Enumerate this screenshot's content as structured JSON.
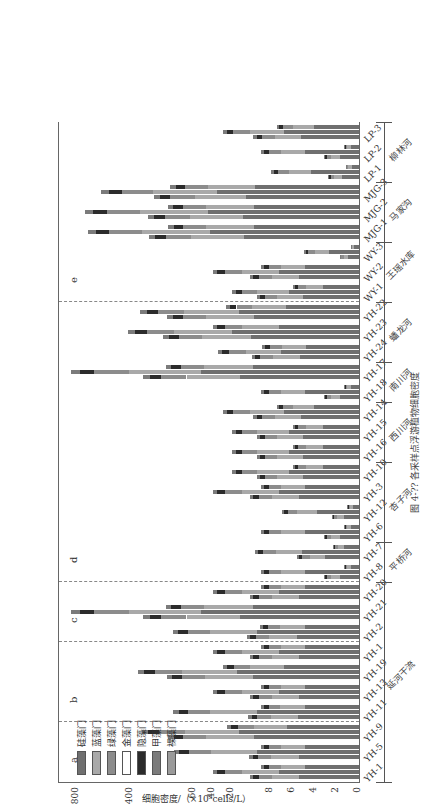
{
  "chart_data": {
    "type": "bar",
    "stacked": true,
    "orientation": "horizontal (figure rotated 90°)",
    "title": "",
    "ylabel": "细胞密度/（×10⁵cells/L）",
    "value_axis_ticks": [
      "0",
      "2",
      "4",
      "6",
      "8",
      "20",
      "40",
      "60",
      "400",
      "800"
    ],
    "axis_breaks": [
      [
        8,
        10
      ],
      [
        60,
        80
      ]
    ],
    "categories": [
      "YH-1",
      "YH-5",
      "YH-9",
      "YH-11",
      "YH-13",
      "YH-19",
      "YH-1",
      "YH-2",
      "YH-21",
      "YH-20",
      "YH-8",
      "YH-7",
      "YH-6",
      "YH-12",
      "YH-3",
      "YH-10",
      "YH-16",
      "YH-15",
      "YH-14",
      "YH-18",
      "YH-17",
      "YH-24",
      "YH-23",
      "YH-22",
      "WY-1",
      "WY-2",
      "WY-3",
      "MJG-1",
      "MJG-2",
      "MJG-3",
      "LP-1",
      "LP-2",
      "LP-3"
    ],
    "legend": [
      "硅藻门",
      "蓝藻门",
      "绿藻门",
      "金藻门",
      "隐藻门",
      "甲藻门",
      "裸藻门"
    ],
    "series_colors": [
      "#6f6f6f",
      "#a9a9a9",
      "#8c8c8c",
      "#ffffff",
      "#2b2b2b",
      "#7b7b7b",
      "#9a9a9a"
    ],
    "regions": [
      {
        "label": "a",
        "from": "YH-1",
        "to": "YH-9"
      },
      {
        "label": "b",
        "from": "YH-11",
        "to": "YH-1"
      },
      {
        "label": "c",
        "from": "YH-2",
        "to": "YH-20"
      },
      {
        "label": "d",
        "from": "YH-8",
        "to": "YH-22"
      },
      {
        "label": "e",
        "from": "WY-1",
        "to": "LP-3"
      }
    ],
    "groups": [
      {
        "label": "延河干流",
        "from": "YH-1",
        "to": "YH-20"
      },
      {
        "label": "平桥河",
        "from": "YH-8",
        "to": "YH-7"
      },
      {
        "label": "杏子河",
        "from": "YH-6",
        "to": "YH-10"
      },
      {
        "label": "西川河",
        "from": "YH-16",
        "to": "YH-14"
      },
      {
        "label": "南川河",
        "from": "YH-18",
        "to": "YH-17"
      },
      {
        "label": "蟠龙河",
        "from": "YH-24",
        "to": "YH-22"
      },
      {
        "label": "王瑶水库",
        "from": "WY-1",
        "to": "WY-3"
      },
      {
        "label": "马家沟",
        "from": "MJG-1",
        "to": "MJG-3"
      },
      {
        "label": "柳林河",
        "from": "LP-1",
        "to": "LP-3"
      }
    ],
    "totals_approx": [
      60,
      62,
      300,
      65,
      60,
      330,
      60,
      70,
      820,
      60,
      9,
      16,
      9,
      7,
      60,
      40,
      40,
      40,
      50,
      9,
      820,
      55,
      400,
      310,
      40,
      60,
      5,
      700,
      720,
      600,
      8,
      9,
      50
    ]
  },
  "legend": {
    "items": [
      "硅藻门",
      "蓝藻门",
      "绿藻门",
      "金藻门",
      "隐藻门",
      "甲藻门",
      "裸藻门"
    ]
  },
  "axis": {
    "title": "细胞密度/（×10⁵cells/L）",
    "ticks": [
      {
        "label": "0",
        "pos": 0
      },
      {
        "label": "2",
        "pos": 22
      },
      {
        "label": "4",
        "pos": 44
      },
      {
        "label": "6",
        "pos": 66
      },
      {
        "label": "8",
        "pos": 88
      },
      {
        "label": "20",
        "pos": 127
      },
      {
        "label": "40",
        "pos": 146
      },
      {
        "label": "60",
        "pos": 165
      },
      {
        "label": "400",
        "pos": 228
      },
      {
        "label": "800",
        "pos": 282
      }
    ]
  },
  "caption": "图 4-?? 各采样点浮游植物细胞密度"
}
